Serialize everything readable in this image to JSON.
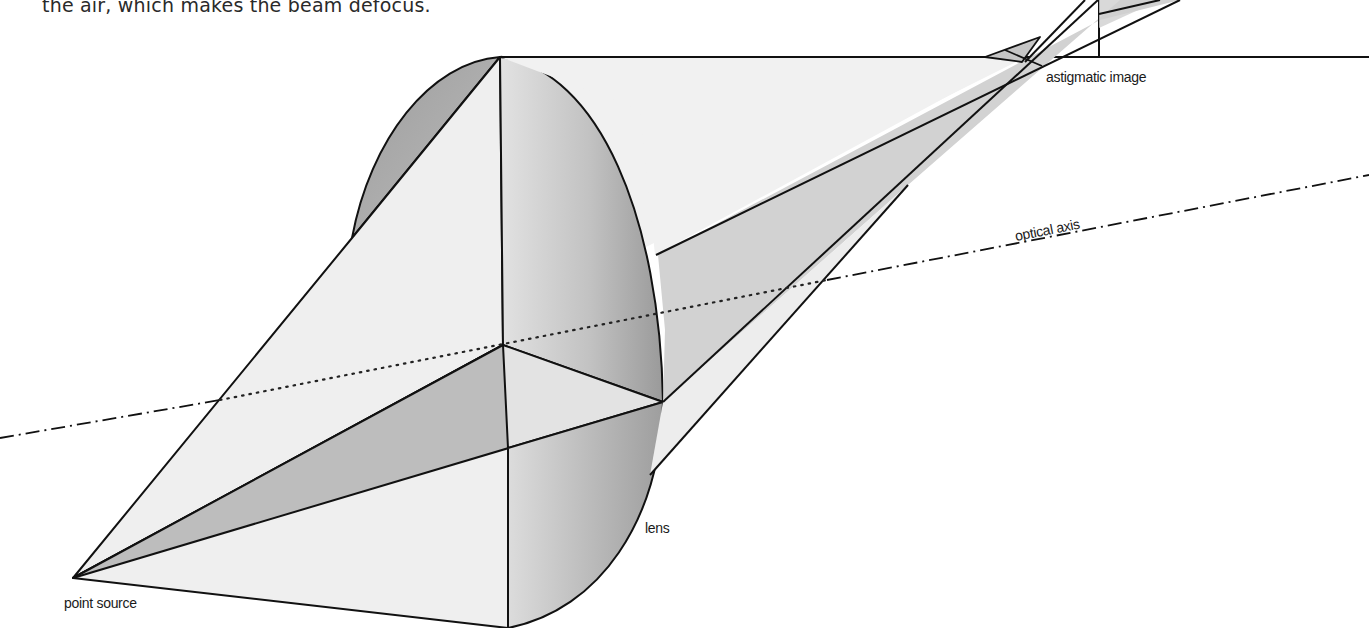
{
  "caption": {
    "text": "the air, which makes the beam defocus."
  },
  "diagram": {
    "labels": {
      "point_source": "point source",
      "lens": "lens",
      "optical_axis": "optical axis",
      "astigmatic_image": "astigmatic image"
    },
    "colors": {
      "stroke": "#111111",
      "light_fill": "#ececec",
      "mid_fill": "#c9c9c9",
      "dark_fill": "#a8a8a8",
      "background": "#ffffff"
    }
  }
}
